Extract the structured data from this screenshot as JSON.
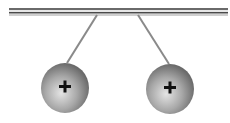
{
  "diagram": {
    "rod": {
      "x1": 9,
      "x2": 228,
      "y": 12
    },
    "spheres": [
      {
        "id": "left",
        "cx": 65,
        "cy": 88,
        "r": 24,
        "charge": "+",
        "string_top": [
          97,
          15
        ],
        "string_bottom": [
          67,
          63
        ]
      },
      {
        "id": "right",
        "cx": 170,
        "cy": 89,
        "r": 24,
        "charge": "+",
        "string_top": [
          138,
          15
        ],
        "string_bottom": [
          169,
          64
        ]
      }
    ],
    "colors": {
      "rod_dark": "#555555",
      "rod_light": "#d8d8d8",
      "string": "#8a8a8a",
      "sphere_light": "#e0e0e0",
      "sphere_dark": "#6e6e6e",
      "sign": "#111111"
    }
  }
}
